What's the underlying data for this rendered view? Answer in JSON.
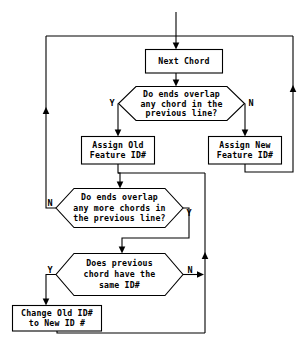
{
  "diagram": {
    "type": "flowchart",
    "background_color": "#ffffff",
    "line_color": "#000000",
    "text_color": "#000000",
    "nodes": [
      {
        "id": "next-chord",
        "shape": "process",
        "lines": [
          "Next Chord"
        ]
      },
      {
        "id": "overlap-any-chord",
        "shape": "decision",
        "lines": [
          "Do ends overlap",
          "any chord in the",
          "previous line?"
        ]
      },
      {
        "id": "assign-old-feature-id",
        "shape": "process",
        "lines": [
          "Assign Old",
          "Feature ID#"
        ]
      },
      {
        "id": "assign-new-feature-id",
        "shape": "process",
        "lines": [
          "Assign New",
          "Feature ID#"
        ]
      },
      {
        "id": "overlap-more-chords",
        "shape": "decision",
        "lines": [
          "Do ends overlap",
          "any more chords in",
          "the previous line?"
        ]
      },
      {
        "id": "previous-chord-same-id",
        "shape": "decision",
        "lines": [
          "Does previous",
          "chord have the",
          "same ID#"
        ]
      },
      {
        "id": "change-old-id-to-new-id",
        "shape": "process",
        "lines": [
          "Change Old ID#",
          "to New ID #"
        ]
      }
    ],
    "branch_labels": [
      {
        "id": "overlap-any-chord-yes",
        "text": "Y"
      },
      {
        "id": "overlap-any-chord-no",
        "text": "N"
      },
      {
        "id": "overlap-more-chords-no",
        "text": "N"
      },
      {
        "id": "overlap-more-chords-yes",
        "text": "Y"
      },
      {
        "id": "previous-chord-same-id-yes",
        "text": "Y"
      },
      {
        "id": "previous-chord-same-id-no",
        "text": "N"
      }
    ]
  }
}
